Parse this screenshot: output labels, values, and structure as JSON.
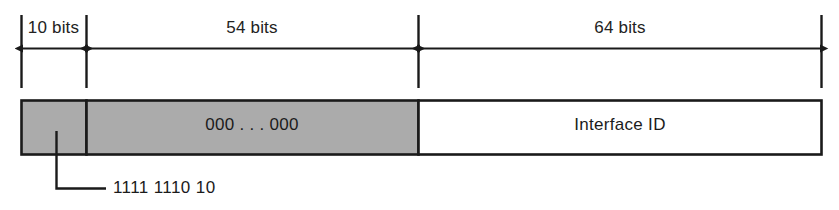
{
  "diagram": {
    "colors": {
      "background": "#ffffff",
      "stroke": "#1a1a1a",
      "fill_gray": "#ababab",
      "fill_white": "#ffffff",
      "text": "#1b1b1b"
    },
    "measure_bar": {
      "segments": [
        {
          "name": "prefix",
          "label": "10 bits",
          "bits": 10
        },
        {
          "name": "zeros",
          "label": "54 bits",
          "bits": 54
        },
        {
          "name": "interface-id",
          "label": "64 bits",
          "bits": 64
        }
      ]
    },
    "address_bar": {
      "fields": [
        {
          "name": "prefix",
          "label": "",
          "fill": "gray"
        },
        {
          "name": "zeros",
          "label": "000 . . . 000",
          "fill": "gray"
        },
        {
          "name": "interface-id",
          "label": "Interface ID",
          "fill": "white"
        }
      ]
    },
    "callout": {
      "target_field": "prefix",
      "label": "1111 1110 10"
    }
  }
}
